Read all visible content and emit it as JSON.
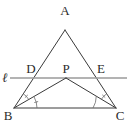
{
  "figure": {
    "type": "geometry-diagram",
    "background_color": "#ffffff",
    "stroke_color": "#3a3a3a",
    "transversal_color": "#9a9a9a",
    "mark_color": "#6b6b6b",
    "width": 129,
    "height": 122
  },
  "points": {
    "A": {
      "label": "A",
      "x": 65,
      "y": 30,
      "label_x": 65,
      "label_y": 15
    },
    "B": {
      "label": "B",
      "x": 14,
      "y": 108,
      "label_x": 8,
      "label_y": 120
    },
    "C": {
      "label": "C",
      "x": 116,
      "y": 108,
      "label_x": 120,
      "label_y": 120
    },
    "D": {
      "label": "D",
      "x": 35,
      "y": 78,
      "label_x": 31,
      "label_y": 73
    },
    "E": {
      "label": "E",
      "x": 97,
      "y": 78,
      "label_x": 101,
      "label_y": 73
    },
    "P": {
      "label": "P",
      "x": 66,
      "y": 78,
      "label_x": 66,
      "label_y": 73
    }
  },
  "line_label": {
    "name": "ell",
    "text": "ℓ",
    "label_x": 5,
    "label_y": 82
  },
  "segments": [
    {
      "name": "side-AB",
      "from": "A",
      "to": "B"
    },
    {
      "name": "side-AC",
      "from": "A",
      "to": "C"
    },
    {
      "name": "side-BC",
      "from": "B",
      "to": "C"
    },
    {
      "name": "segment-BP",
      "from": "B",
      "to": "P"
    },
    {
      "name": "segment-PC",
      "from": "P",
      "to": "C"
    }
  ],
  "transversal": {
    "name": "line-ell",
    "x1": 10,
    "x2": 127,
    "y": 78
  },
  "angle_marks": [
    {
      "name": "angle-mark-DBP",
      "vertex": "B",
      "ticks": 1
    },
    {
      "name": "angle-mark-PBC",
      "vertex": "B",
      "ticks": 1
    },
    {
      "name": "angle-mark-ECP",
      "vertex": "C",
      "ticks": 1
    },
    {
      "name": "angle-mark-PCB",
      "vertex": "C",
      "ticks": 1
    }
  ]
}
